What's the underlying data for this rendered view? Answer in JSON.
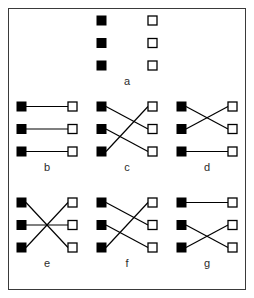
{
  "figure": {
    "frame": {
      "border_color": "#3a3a3a",
      "background_color": "#ffffff",
      "border_width_px": 1.5
    },
    "node_style": {
      "left_node_fill": "#000000",
      "left_node_stroke": "#000000",
      "right_node_fill": "#ffffff",
      "right_node_stroke": "#000000",
      "edge_color": "#000000",
      "node_size_px": 9,
      "edge_width_px": 1.2
    },
    "layout": {
      "rows": 3,
      "columns_row1": 1,
      "columns_row2": 3,
      "columns_row3": 3
    }
  },
  "panels": [
    {
      "id": "a",
      "label": "a",
      "left_nodes": [
        "L1",
        "L2",
        "L3"
      ],
      "right_nodes": [
        "R1",
        "R2",
        "R3"
      ],
      "edges": [],
      "edge_count": 0,
      "description": "no edges"
    },
    {
      "id": "b",
      "label": "b",
      "left_nodes": [
        "L1",
        "L2",
        "L3"
      ],
      "right_nodes": [
        "R1",
        "R2",
        "R3"
      ],
      "edges": [
        [
          1,
          1
        ],
        [
          2,
          2
        ],
        [
          3,
          3
        ]
      ],
      "edge_count": 3,
      "description": "identity matching, three parallel horizontal edges"
    },
    {
      "id": "c",
      "label": "c",
      "left_nodes": [
        "L1",
        "L2",
        "L3"
      ],
      "right_nodes": [
        "R1",
        "R2",
        "R3"
      ],
      "edges": [
        [
          1,
          2
        ],
        [
          2,
          3
        ],
        [
          3,
          1
        ]
      ],
      "edge_count": 3,
      "description": "cyclic shift down, two crossings"
    },
    {
      "id": "d",
      "label": "d",
      "left_nodes": [
        "L1",
        "L2",
        "L3"
      ],
      "right_nodes": [
        "R1",
        "R2",
        "R3"
      ],
      "edges": [
        [
          1,
          2
        ],
        [
          2,
          1
        ],
        [
          3,
          3
        ]
      ],
      "edge_count": 3,
      "description": "top two swapped, bottom horizontal"
    },
    {
      "id": "e",
      "label": "e",
      "left_nodes": [
        "L1",
        "L2",
        "L3"
      ],
      "right_nodes": [
        "R1",
        "R2",
        "R3"
      ],
      "edges": [
        [
          1,
          3
        ],
        [
          2,
          2
        ],
        [
          3,
          1
        ]
      ],
      "edge_count": 3,
      "description": "outer pair swapped, middle horizontal, single central crossing"
    },
    {
      "id": "f",
      "label": "f",
      "left_nodes": [
        "L1",
        "L2",
        "L3"
      ],
      "right_nodes": [
        "R1",
        "R2",
        "R3"
      ],
      "edges": [
        [
          1,
          2
        ],
        [
          2,
          3
        ],
        [
          3,
          1
        ]
      ],
      "edge_count": 3,
      "description": "cyclic shift down variant"
    },
    {
      "id": "g",
      "label": "g",
      "left_nodes": [
        "L1",
        "L2",
        "L3"
      ],
      "right_nodes": [
        "R1",
        "R2",
        "R3"
      ],
      "edges": [
        [
          1,
          1
        ],
        [
          2,
          3
        ],
        [
          3,
          2
        ]
      ],
      "edge_count": 3,
      "description": "top horizontal, bottom two swapped"
    }
  ]
}
